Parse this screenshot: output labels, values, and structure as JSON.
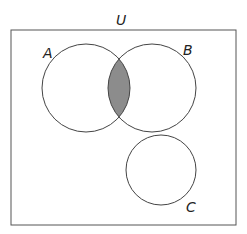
{
  "diagram": {
    "type": "venn",
    "universe_label": "U",
    "sets": [
      {
        "label": "A",
        "cx": 86,
        "cy": 88,
        "r": 44
      },
      {
        "label": "B",
        "cx": 152,
        "cy": 88,
        "r": 44
      },
      {
        "label": "C",
        "cx": 161,
        "cy": 170,
        "r": 35
      }
    ],
    "shaded_region": "A ∩ B",
    "colors": {
      "stroke": "#444444",
      "shade": "#8c8c8c",
      "background": "#ffffff"
    }
  }
}
